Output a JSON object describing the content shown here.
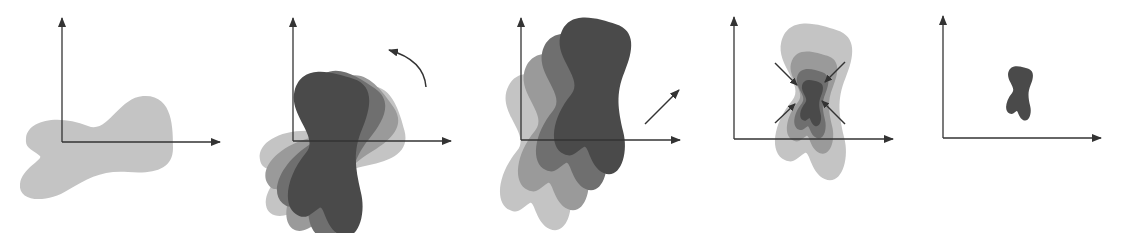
{
  "diagram": {
    "colors": {
      "light": "#c4c4c4",
      "medium": "#9a9a9a",
      "mid_dark": "#6f6f6f",
      "dark": "#4a4a4a",
      "axis": "#333333"
    },
    "panels": [
      {
        "id": "original",
        "step": "original shape",
        "indicator": "none"
      },
      {
        "id": "rotation",
        "step": "rotate",
        "indicator": "curved-arrow-counterclockwise"
      },
      {
        "id": "translation",
        "step": "translate",
        "indicator": "diagonal-arrow-up-right"
      },
      {
        "id": "scaling",
        "step": "scale down",
        "indicator": "four-inward-arrows"
      },
      {
        "id": "result",
        "step": "final shape",
        "indicator": "none"
      }
    ]
  }
}
